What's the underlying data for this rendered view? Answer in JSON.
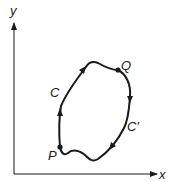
{
  "diagram": {
    "axes": {
      "x_label": "x",
      "y_label": "y"
    },
    "points": {
      "P": {
        "label": "P"
      },
      "Q": {
        "label": "Q"
      }
    },
    "paths": {
      "C": {
        "label": "C",
        "direction": "P to Q (upper-left path, arrows pointing up/right)"
      },
      "C_prime": {
        "label": "C′",
        "direction": "Q to P (lower-right path, arrows pointing down/left)"
      }
    },
    "colors": {
      "stroke": "#1a1a1a",
      "background": "#ffffff"
    }
  }
}
